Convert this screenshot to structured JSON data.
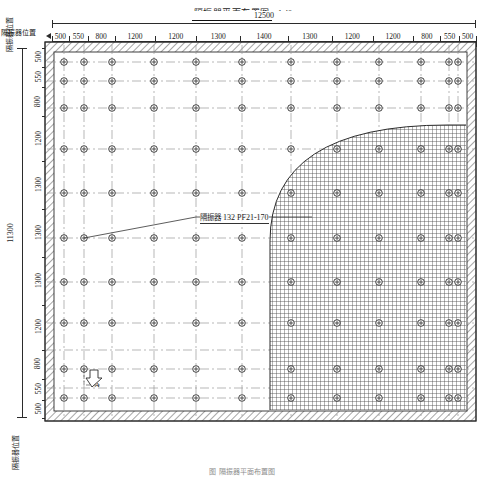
{
  "title": {
    "text": "隔振器平面布置图",
    "scale": "1:40"
  },
  "overall": {
    "top_label": "12500",
    "left_label": "11300"
  },
  "labels": {
    "top_position": "隔振器位置",
    "left_position_top": "隔振器位置",
    "left_position_bottom": "隔振器位置",
    "arrow_a": "A"
  },
  "dimensions": {
    "top_units": "mm",
    "top": [
      "500",
      "550",
      "800",
      "1200",
      "1200",
      "1300",
      "1400",
      "1300",
      "1200",
      "1200",
      "800",
      "550",
      "500"
    ],
    "left": [
      "500",
      "550",
      "800",
      "1200",
      "1300",
      "1300",
      "1300",
      "1200",
      "800",
      "550",
      "500"
    ]
  },
  "annotation": {
    "prefix": "隔振器",
    "spec": "132 PF21-170",
    "full": "隔振器 132 PF21-170"
  },
  "caption": {
    "text": "图   隔振器平面布置图"
  },
  "colors": {
    "paper": "#ffffff",
    "line": "#2b2b2b",
    "grid": "#8a8a8a",
    "hatch": "#444444",
    "wall_fill": "#f2f2f2",
    "crosshatch": "#555555"
  },
  "chart_data": {
    "type": "table",
    "xlabel": "12500",
    "ylabel": "11300",
    "legend": [
      "隔振器 132 PF21-170"
    ],
    "grid_columns": 12,
    "grid_rows": 10,
    "isolator_count": 120,
    "x_spacings": [
      500,
      550,
      800,
      1200,
      1200,
      1300,
      1400,
      1300,
      1200,
      1200,
      800,
      550,
      500
    ],
    "y_spacings": [
      500,
      550,
      800,
      1200,
      1300,
      1300,
      1300,
      1200,
      800,
      550,
      500
    ],
    "x_total": 12500,
    "y_total": 11300
  }
}
